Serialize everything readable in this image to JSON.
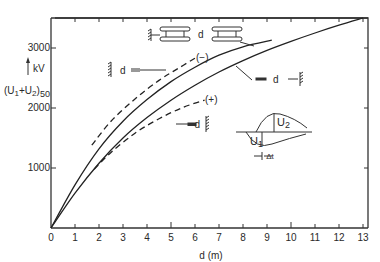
{
  "chart_data": {
    "type": "line",
    "title": "",
    "xlabel": "d (m)",
    "ylabel_unit": "kV",
    "ylabel": "(U1+U2)50",
    "xlim": [
      0,
      13
    ],
    "ylim": [
      0,
      3500
    ],
    "xticks": [
      0,
      1,
      2,
      3,
      4,
      5,
      6,
      7,
      8,
      9,
      10,
      11,
      12,
      13
    ],
    "yticks": [
      1000,
      2000,
      3000
    ],
    "ytick_labels": [
      "1000",
      "2000",
      "3000"
    ],
    "grid": false,
    "series": [
      {
        "name": "rod-rod (switching impulse, both electrodes)",
        "style": "solid",
        "x": [
          0,
          1,
          2,
          3,
          4,
          5,
          6,
          7,
          8,
          9.2
        ],
        "y": [
          0,
          720,
          1320,
          1780,
          2140,
          2440,
          2680,
          2880,
          3020,
          3130
        ]
      },
      {
        "name": "rod-plane",
        "style": "solid",
        "x": [
          0,
          1,
          2,
          3,
          4,
          5,
          6,
          7,
          8,
          9,
          10,
          11,
          12,
          13
        ],
        "y": [
          0,
          580,
          1080,
          1500,
          1840,
          2130,
          2380,
          2600,
          2790,
          2960,
          3110,
          3250,
          3380,
          3500
        ]
      },
      {
        "name": "(-) rod-plane, negative",
        "label": "(−)",
        "style": "dashed",
        "x": [
          1.7,
          2.5,
          3.5,
          4.5,
          5.3,
          6.0
        ],
        "y": [
          1380,
          1780,
          2150,
          2460,
          2660,
          2830
        ]
      },
      {
        "name": "(+) rod-plane, positive",
        "label": "(+)",
        "style": "dashed",
        "x": [
          1.8,
          2.5,
          3.5,
          4.5,
          5.5,
          6.4
        ],
        "y": [
          980,
          1260,
          1580,
          1820,
          2010,
          2130
        ]
      }
    ],
    "annotations": [
      {
        "text": "d",
        "context": "rod-rod electrode sketch near upper solid curve"
      },
      {
        "text": "d",
        "context": "rod-plane electrode sketch near lower solid curve"
      },
      {
        "text": "d",
        "context": "negative rod-plane sketch near (−) dashed curve"
      },
      {
        "text": "d",
        "context": "positive rod-plane sketch near (+) dashed curve"
      },
      {
        "text": "(−)"
      },
      {
        "text": "(+)"
      },
      {
        "text": "U2"
      },
      {
        "text": "U1"
      },
      {
        "text": "Δt"
      }
    ]
  },
  "labels": {
    "y_tick_3000": "3000",
    "y_tick_2000": "2000",
    "y_tick_1000": "1000",
    "y_unit": "kV",
    "y_name_prefix": "(U",
    "y_name_sub1": "1",
    "y_name_plus": "+U",
    "y_name_sub2": "2",
    "y_name_close": ")",
    "y_name_sub50": "50",
    "x_name": "d (m)",
    "d": "d",
    "minus": "(−)",
    "plus": "(+)",
    "u1": "U",
    "u1_sub": "1",
    "u2": "U",
    "u2_sub": "2",
    "dt": "Δt"
  }
}
